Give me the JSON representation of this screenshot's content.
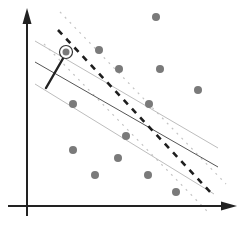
{
  "diagram": {
    "title": "",
    "colors": {
      "axis": "#222222",
      "point": "#7a7a7a",
      "hyperplane": "#1e1e1e",
      "solid_line_dark": "#555555",
      "solid_line_light": "#bdbdbd",
      "dotted_line": "#c4c4c4",
      "stick": "#222222"
    },
    "points": [
      {
        "x": 156,
        "y": 17
      },
      {
        "x": 99,
        "y": 50
      },
      {
        "x": 119,
        "y": 69
      },
      {
        "x": 160,
        "y": 69
      },
      {
        "x": 198,
        "y": 90
      },
      {
        "x": 73,
        "y": 104
      },
      {
        "x": 149,
        "y": 104
      },
      {
        "x": 126,
        "y": 136
      },
      {
        "x": 73,
        "y": 150
      },
      {
        "x": 118,
        "y": 158
      },
      {
        "x": 95,
        "y": 175
      },
      {
        "x": 148,
        "y": 175
      },
      {
        "x": 176,
        "y": 192
      }
    ],
    "highlighted_point": {
      "x": 66,
      "y": 52
    },
    "lines": {
      "hyperplane_dashed": {
        "x1": 58,
        "y1": 30,
        "x2": 214,
        "y2": 196
      },
      "dotted_upper": {
        "x1": 60,
        "y1": 12,
        "x2": 226,
        "y2": 184
      },
      "dotted_lower": {
        "x1": 44,
        "y1": 44,
        "x2": 208,
        "y2": 212
      },
      "solid_upper": {
        "x1": 35,
        "y1": 41,
        "x2": 218,
        "y2": 148
      },
      "solid_middle": {
        "x1": 35,
        "y1": 62,
        "x2": 218,
        "y2": 167
      },
      "solid_lower": {
        "x1": 35,
        "y1": 84,
        "x2": 214,
        "y2": 194
      },
      "stick": {
        "x1": 46,
        "y1": 88,
        "x2": 65,
        "y2": 55
      }
    },
    "axes": {
      "y_axis": {
        "x": 27,
        "y_top": 8,
        "y_bottom": 216
      },
      "x_axis": {
        "y": 206,
        "x_left": 8,
        "x_right": 237
      }
    }
  }
}
